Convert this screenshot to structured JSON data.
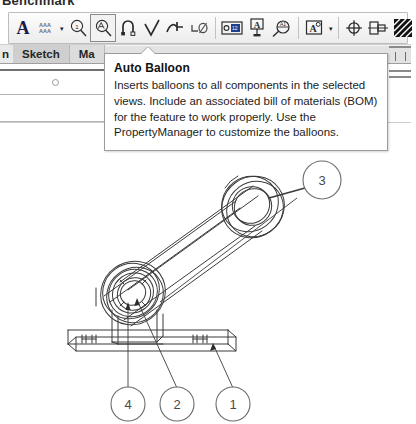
{
  "page": {
    "clipped_heading": "Benchmark"
  },
  "toolbar": {
    "name": "annotation-toolbar",
    "items": [
      {
        "id": "note",
        "icon": "note-A-icon",
        "label": "Note",
        "selected": false,
        "has_dropdown": false
      },
      {
        "id": "spell-checker",
        "icon": "spell-checker-icon",
        "label": "Spell Checker",
        "selected": false,
        "has_dropdown": true
      },
      {
        "id": "balloon",
        "icon": "balloon-icon",
        "label": "Balloon",
        "selected": false,
        "has_dropdown": false
      },
      {
        "id": "auto-balloon",
        "icon": "auto-balloon-icon",
        "label": "Auto Balloon",
        "selected": true,
        "has_dropdown": false
      },
      {
        "id": "magnetic-line",
        "icon": "magnetic-line-icon",
        "label": "Magnetic Line",
        "selected": false,
        "has_dropdown": false
      },
      {
        "id": "surface-finish",
        "icon": "surface-finish-icon",
        "label": "Surface Finish",
        "selected": false,
        "has_dropdown": false
      },
      {
        "id": "weld-symbol",
        "icon": "weld-symbol-icon",
        "label": "Weld Symbol",
        "selected": false,
        "has_dropdown": false
      },
      {
        "id": "geometric-tol",
        "icon": "geometric-tolerance-icon",
        "label": "Geometric Tolerance",
        "selected": false,
        "has_dropdown": false
      },
      {
        "id": "datum-feature",
        "icon": "datum-feature-icon",
        "label": "Datum Feature",
        "selected": false,
        "has_dropdown": false
      },
      {
        "id": "datum-target",
        "icon": "datum-target-icon",
        "label": "Datum Target",
        "selected": false,
        "has_dropdown": false
      },
      {
        "id": "hole-callout",
        "icon": "hole-callout-icon",
        "label": "Hole Callout",
        "selected": false,
        "has_dropdown": false
      },
      {
        "id": "revision-symbol",
        "icon": "revision-symbol-icon",
        "label": "Revision Symbol",
        "selected": false,
        "has_dropdown": true
      },
      {
        "id": "center-mark",
        "icon": "center-mark-icon",
        "label": "Center Mark",
        "selected": false,
        "has_dropdown": false
      },
      {
        "id": "centerline",
        "icon": "centerline-icon",
        "label": "Centerline",
        "selected": false,
        "has_dropdown": false
      },
      {
        "id": "area-hatch-fill",
        "icon": "area-hatch-fill-icon",
        "label": "Area Hatch/Fill",
        "selected": false,
        "has_dropdown": false
      }
    ],
    "dropdown_caret": "▾"
  },
  "tabs": {
    "clipped_first": "n",
    "items": [
      {
        "id": "sketch",
        "label": "Sketch",
        "active": true
      },
      {
        "id": "markup",
        "label": "Ma",
        "active": false
      }
    ]
  },
  "tooltip": {
    "title": "Auto Balloon",
    "body": "Inserts balloons to all components in the selected views. Include an associated bill of materials (BOM) for the feature to work properly. Use the PropertyManager to customize the balloons."
  },
  "drawing": {
    "name": "connecting-rod-assembly-drawing",
    "balloons": [
      {
        "id": "balloon-3",
        "label": "3",
        "cx": 322,
        "cy": 50
      },
      {
        "id": "balloon-4",
        "label": "4",
        "cx": 128,
        "cy": 274
      },
      {
        "id": "balloon-2",
        "label": "2",
        "cx": 177,
        "cy": 274
      },
      {
        "id": "balloon-1",
        "label": "1",
        "cx": 233,
        "cy": 274
      }
    ]
  }
}
